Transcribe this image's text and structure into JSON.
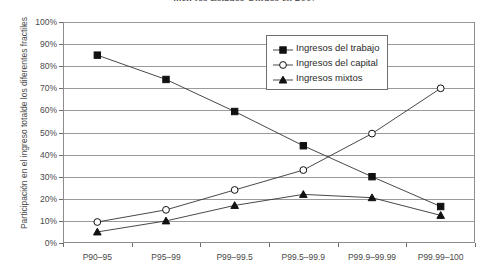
{
  "chart_data": {
    "type": "line",
    "title": "...en los Estados Unidos en 2007",
    "xlabel": "",
    "ylabel": "Participación en el ingreso totalde los diferentes fractiles",
    "categories": [
      "P90–95",
      "P95–99",
      "P99–99.5",
      "P99.5–99.9",
      "P99.9–99.99",
      "P99.99–100"
    ],
    "ylim": [
      0,
      100
    ],
    "ytick_labels": [
      "0%",
      "10%",
      "20%",
      "30%",
      "40%",
      "50%",
      "60%",
      "70%",
      "80%",
      "90%",
      "100%"
    ],
    "ytick_values": [
      0,
      10,
      20,
      30,
      40,
      50,
      60,
      70,
      80,
      90,
      100
    ],
    "grid": true,
    "legend_position": "top-center-right",
    "series": [
      {
        "name": "Ingresos del trabajo",
        "marker": "filled-square",
        "values": [
          85,
          74,
          59.5,
          44,
          30,
          16.5
        ]
      },
      {
        "name": "Ingresos del capital",
        "marker": "open-circle",
        "values": [
          9.5,
          15,
          24,
          33,
          49.5,
          70
        ]
      },
      {
        "name": "Ingresos mixtos",
        "marker": "filled-triangle",
        "values": [
          5,
          10,
          17,
          22,
          20.5,
          12.5
        ]
      }
    ]
  },
  "colors": {
    "line": "#333333",
    "grid": "#9a9a9a",
    "axis": "#8d8d8d",
    "text": "#2b2b2b"
  }
}
